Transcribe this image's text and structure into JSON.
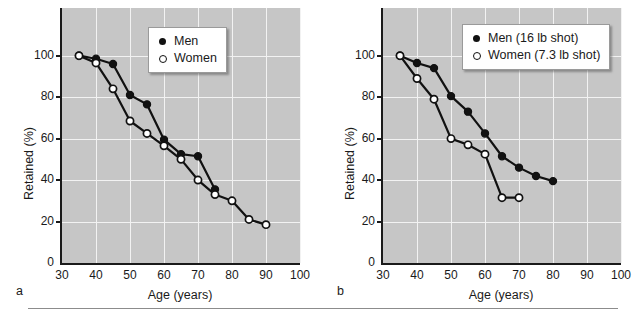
{
  "figure": {
    "panels": [
      {
        "letter": "a",
        "xlabel": "Age (years)",
        "ylabel": "Retained (%)",
        "legend": [
          {
            "marker": "filled-dot",
            "label": "Men"
          },
          {
            "marker": "open-circle",
            "label": "Women"
          }
        ]
      },
      {
        "letter": "b",
        "xlabel": "Age (years)",
        "ylabel": "Retained (%)",
        "legend": [
          {
            "marker": "filled-dot",
            "label": "Men (16 lb shot)"
          },
          {
            "marker": "open-circle",
            "label": "Women (7.3 lb shot)"
          }
        ]
      }
    ],
    "xticks": [
      "30",
      "40",
      "50",
      "60",
      "70",
      "80",
      "90",
      "100"
    ],
    "yticks": [
      "0",
      "20",
      "40",
      "60",
      "80",
      "100"
    ]
  },
  "chart_data": [
    {
      "type": "line",
      "panel": "a",
      "title": "",
      "xlabel": "Age (years)",
      "ylabel": "Retained (%)",
      "xlim": [
        30,
        100
      ],
      "ylim": [
        0,
        123
      ],
      "xticks": [
        30,
        40,
        50,
        60,
        70,
        80,
        90,
        100
      ],
      "yticks": [
        0,
        20,
        40,
        60,
        80,
        100
      ],
      "grid": true,
      "legend_position": "top-right",
      "series": [
        {
          "name": "Men",
          "marker": "filled-circle",
          "x": [
            35,
            40,
            45,
            50,
            55,
            60,
            65,
            70,
            75
          ],
          "y": [
            100,
            98.5,
            96,
            81,
            76.5,
            59.5,
            52.5,
            51.5,
            35.5
          ]
        },
        {
          "name": "Women",
          "marker": "open-circle",
          "x": [
            35,
            40,
            45,
            50,
            55,
            60,
            65,
            70,
            75,
            80,
            85,
            90
          ],
          "y": [
            100,
            96.5,
            84,
            68.5,
            62.5,
            56.5,
            50,
            40,
            33,
            30,
            21,
            18.5
          ]
        }
      ]
    },
    {
      "type": "line",
      "panel": "b",
      "title": "",
      "xlabel": "Age (years)",
      "ylabel": "Retained (%)",
      "xlim": [
        30,
        100
      ],
      "ylim": [
        0,
        123
      ],
      "xticks": [
        30,
        40,
        50,
        60,
        70,
        80,
        90,
        100
      ],
      "yticks": [
        0,
        20,
        40,
        60,
        80,
        100
      ],
      "grid": true,
      "legend_position": "top-right",
      "series": [
        {
          "name": "Men (16 lb shot)",
          "marker": "filled-circle",
          "x": [
            35,
            40,
            45,
            50,
            55,
            60,
            65,
            70,
            75,
            80
          ],
          "y": [
            100,
            96.5,
            94,
            80.5,
            73,
            62.5,
            51.5,
            46,
            42,
            39.5
          ]
        },
        {
          "name": "Women (7.3 lb shot)",
          "marker": "open-circle",
          "x": [
            35,
            40,
            45,
            50,
            55,
            60,
            65,
            70
          ],
          "y": [
            100,
            89,
            79,
            60,
            57,
            52.5,
            31.5,
            31.5
          ]
        }
      ]
    }
  ]
}
